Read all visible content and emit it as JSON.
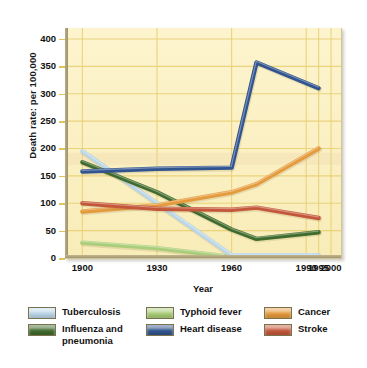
{
  "chart_data": {
    "type": "line",
    "title": "",
    "xlabel": "Year",
    "ylabel": "Death rate: per 100,000",
    "x": [
      1900,
      1930,
      1960,
      1970,
      1995
    ],
    "xtick_labels": [
      "1900",
      "1930",
      "1960",
      "1990",
      "1995",
      "2000"
    ],
    "xtick_values": [
      1900,
      1930,
      1960,
      1990,
      1995,
      2000
    ],
    "ytick_labels": [
      "0",
      "50",
      "100",
      "150",
      "200",
      "250",
      "300",
      "350",
      "400"
    ],
    "ytick_values": [
      0,
      50,
      100,
      150,
      200,
      250,
      300,
      350,
      400
    ],
    "ylim": [
      0,
      420
    ],
    "xlim": [
      1893,
      2004
    ],
    "grid": true,
    "legend_position": "below",
    "series": [
      {
        "name": "Tuberculosis",
        "color": "#b9d6e8",
        "x": [
          1900,
          1930,
          1960,
          1970,
          1995
        ],
        "values": [
          195,
          100,
          5,
          5,
          5
        ]
      },
      {
        "name": "Influenza and\npneumonia",
        "color": "#3f6b2c",
        "x": [
          1900,
          1930,
          1960,
          1970,
          1995
        ],
        "values": [
          175,
          120,
          52,
          35,
          47
        ]
      },
      {
        "name": "Typhoid fever",
        "color": "#a9cd78",
        "x": [
          1900,
          1930,
          1960,
          1970,
          1995
        ],
        "values": [
          28,
          18,
          2,
          0,
          0
        ]
      },
      {
        "name": "Heart disease",
        "color": "#31548f",
        "x": [
          1900,
          1930,
          1960,
          1970,
          1995
        ],
        "values": [
          158,
          163,
          165,
          357,
          310
        ]
      },
      {
        "name": "Cancer",
        "color": "#e59a3c",
        "x": [
          1900,
          1930,
          1960,
          1970,
          1995
        ],
        "values": [
          85,
          96,
          120,
          135,
          200
        ]
      },
      {
        "name": "Stroke",
        "color": "#c4573a",
        "x": [
          1900,
          1930,
          1960,
          1970,
          1995
        ],
        "values": [
          100,
          90,
          88,
          92,
          73
        ]
      }
    ]
  },
  "axes": {
    "y_title": "Death rate: per 100,000",
    "x_title": "Year"
  },
  "legend": {
    "items": [
      {
        "label": "Tuberculosis",
        "color": "#b9d6e8"
      },
      {
        "label": "Influenza and\npneumonia",
        "color": "#3f6b2c"
      },
      {
        "label": "Typhoid fever",
        "color": "#a9cd78"
      },
      {
        "label": "Heart disease",
        "color": "#31548f"
      },
      {
        "label": "Cancer",
        "color": "#e59a3c"
      },
      {
        "label": "Stroke",
        "color": "#c4573a"
      }
    ]
  },
  "colors": {
    "plot_background": "#fbf0c4",
    "gridline": "#e8cf72",
    "axis_text": "#111111",
    "page_background": "#ffffff"
  }
}
